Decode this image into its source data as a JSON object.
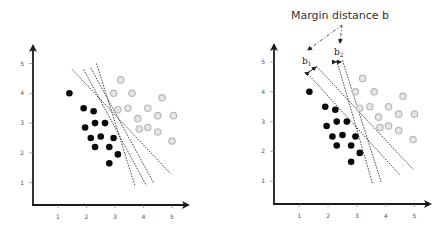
{
  "figure": {
    "title": "Margin distance b",
    "labels": {
      "b1": "b",
      "b1_sub": "1",
      "b2": "b",
      "b2_sub": "2"
    },
    "colors": {
      "axis": "#1a1a1a",
      "class_a_fill": "#0a0a0a",
      "class_b_stroke": "#b8b8b8",
      "class_b_fill": "#e6e6e6",
      "line": "#333333"
    }
  },
  "left_plot": {
    "x_ticks": [
      "1",
      "2",
      "3",
      "4",
      "5"
    ],
    "y_ticks": [
      "1",
      "2",
      "3",
      "4",
      "5"
    ],
    "class_a": [
      [
        1.4,
        4.0
      ],
      [
        1.9,
        3.5
      ],
      [
        2.25,
        3.4
      ],
      [
        2.3,
        3.0
      ],
      [
        2.65,
        3.0
      ],
      [
        1.95,
        2.85
      ],
      [
        2.15,
        2.5
      ],
      [
        2.5,
        2.55
      ],
      [
        2.95,
        2.5
      ],
      [
        2.3,
        2.2
      ],
      [
        2.8,
        2.2
      ],
      [
        3.1,
        1.95
      ],
      [
        2.8,
        1.65
      ]
    ],
    "class_b": [
      [
        3.2,
        4.45
      ],
      [
        2.95,
        4.0
      ],
      [
        3.6,
        4.0
      ],
      [
        4.65,
        3.85
      ],
      [
        3.1,
        3.45
      ],
      [
        3.45,
        3.5
      ],
      [
        4.15,
        3.5
      ],
      [
        4.5,
        3.25
      ],
      [
        5.05,
        3.25
      ],
      [
        3.8,
        3.15
      ],
      [
        3.85,
        2.8
      ],
      [
        4.15,
        2.85
      ],
      [
        4.5,
        2.7
      ],
      [
        5.0,
        2.4
      ]
    ],
    "separators": [
      [
        [
          1.5,
          4.8
        ],
        [
          4.95,
          1.3
        ]
      ],
      [
        [
          1.9,
          4.8
        ],
        [
          4.1,
          0.9
        ]
      ],
      [
        [
          2.15,
          4.85
        ],
        [
          4.35,
          1.0
        ]
      ],
      [
        [
          2.35,
          5.0
        ],
        [
          3.7,
          0.9
        ]
      ]
    ]
  },
  "right_plot": {
    "x_ticks": [
      "1",
      "2",
      "3",
      "4",
      "5"
    ],
    "y_ticks": [
      "1",
      "2",
      "3",
      "4",
      "5"
    ],
    "class_a": [
      [
        1.35,
        4.0
      ],
      [
        1.9,
        3.5
      ],
      [
        2.25,
        3.4
      ],
      [
        2.3,
        3.0
      ],
      [
        2.65,
        3.0
      ],
      [
        1.95,
        2.85
      ],
      [
        2.15,
        2.5
      ],
      [
        2.5,
        2.55
      ],
      [
        2.95,
        2.5
      ],
      [
        2.3,
        2.2
      ],
      [
        2.8,
        2.2
      ],
      [
        3.1,
        1.95
      ],
      [
        2.8,
        1.65
      ]
    ],
    "class_b": [
      [
        3.2,
        4.45
      ],
      [
        2.95,
        4.0
      ],
      [
        3.6,
        4.0
      ],
      [
        4.6,
        3.85
      ],
      [
        3.1,
        3.45
      ],
      [
        3.45,
        3.5
      ],
      [
        4.1,
        3.5
      ],
      [
        4.45,
        3.25
      ],
      [
        5.0,
        3.25
      ],
      [
        3.75,
        3.15
      ],
      [
        3.8,
        2.8
      ],
      [
        4.1,
        2.85
      ],
      [
        4.45,
        2.7
      ],
      [
        4.95,
        2.4
      ]
    ],
    "margin_pairs": [
      {
        "label": "b1",
        "lines": [
          [
            [
              1.3,
              4.6
            ],
            [
              4.5,
              1.2
            ]
          ],
          [
            [
              1.6,
              4.85
            ],
            [
              4.95,
              1.4
            ]
          ]
        ]
      },
      {
        "label": "b2",
        "lines": [
          [
            [
              2.3,
              5.05
            ],
            [
              3.55,
              0.9
            ]
          ],
          [
            [
              2.5,
              5.05
            ],
            [
              3.85,
              0.95
            ]
          ]
        ]
      }
    ]
  }
}
